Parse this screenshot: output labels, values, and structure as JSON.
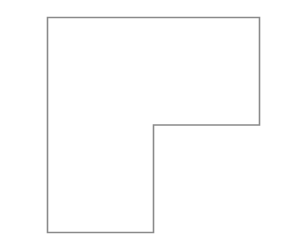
{
  "diagram": {
    "type": "polygon-outline",
    "shape": "L-shape",
    "proportions": {
      "top_section_width_to_leg_width": 2.0,
      "top_section_height_to_total_height": 0.5
    },
    "colors": {
      "background": "#ffffff",
      "fill": "#ffffff",
      "stroke": "#8a8a8a"
    }
  }
}
